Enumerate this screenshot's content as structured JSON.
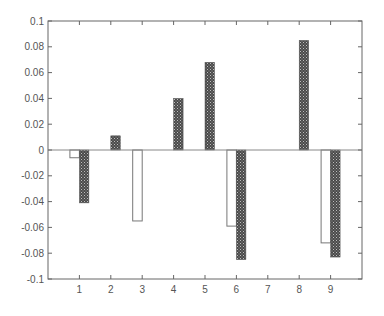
{
  "chart_data": {
    "type": "bar",
    "title": "",
    "xlabel": "",
    "ylabel": "",
    "categories": [
      "1",
      "2",
      "3",
      "4",
      "5",
      "6",
      "7",
      "8",
      "9"
    ],
    "x": [
      1,
      2,
      3,
      4,
      5,
      6,
      7,
      8,
      9
    ],
    "series": [
      {
        "name": "series-1",
        "style": "white",
        "values": [
          -0.006,
          0,
          -0.055,
          0,
          0,
          -0.059,
          0,
          0,
          -0.072
        ]
      },
      {
        "name": "series-2",
        "style": "hatched-dark",
        "values": [
          -0.041,
          0.011,
          0,
          0.04,
          0.068,
          -0.085,
          0,
          0.085,
          -0.083
        ]
      }
    ],
    "xlim": [
      0,
      10
    ],
    "ylim": [
      -0.1,
      0.1
    ],
    "yticks": [
      0.1,
      0.08,
      0.06,
      0.04,
      0.02,
      0,
      -0.02,
      -0.04,
      -0.06,
      -0.08,
      -0.1
    ],
    "ytick_labels": [
      "0.1",
      "0.08",
      "0.06",
      "0.04",
      "0.02",
      "0",
      "-0.02",
      "-0.04",
      "-0.06",
      "-0.08",
      "-0.1"
    ],
    "xticks": [
      1,
      2,
      3,
      4,
      5,
      6,
      7,
      8,
      9
    ],
    "xtick_labels": [
      "1",
      "2",
      "3",
      "4",
      "5",
      "6",
      "7",
      "8",
      "9"
    ],
    "grid": false,
    "legend": null,
    "colors": {
      "axis": "#666666",
      "bar_white_fill": "#ffffff",
      "bar_white_stroke": "#777777",
      "bar_dark_fill": "#4a4a4a",
      "bar_dark_dots": "#bdbdbd"
    }
  }
}
